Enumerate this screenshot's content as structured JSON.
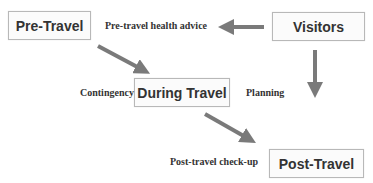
{
  "diagram": {
    "nodes": [
      {
        "id": "pre_travel",
        "label": "Pre-Travel"
      },
      {
        "id": "visitors",
        "label": "Visitors"
      },
      {
        "id": "during_travel",
        "label": "During Travel"
      },
      {
        "id": "post_travel",
        "label": "Post-Travel"
      }
    ],
    "edge_labels": {
      "pre_travel_health_advice": "Pre-travel health advice",
      "contingency": "Contingency",
      "planning": "Planning",
      "post_travel_check_up": "Post-travel check-up"
    },
    "edges": [
      {
        "from": "visitors",
        "to": "pre_travel_health_advice",
        "direction": "left"
      },
      {
        "from": "visitors",
        "to": "below",
        "direction": "down"
      },
      {
        "from": "pre_travel",
        "to": "during_travel",
        "direction": "down-right"
      },
      {
        "from": "during_travel",
        "to": "post_travel",
        "direction": "down-right"
      }
    ],
    "colors": {
      "arrow": "#7a7a7a",
      "box_border": "#b8b8b8",
      "text": "#333333"
    }
  }
}
